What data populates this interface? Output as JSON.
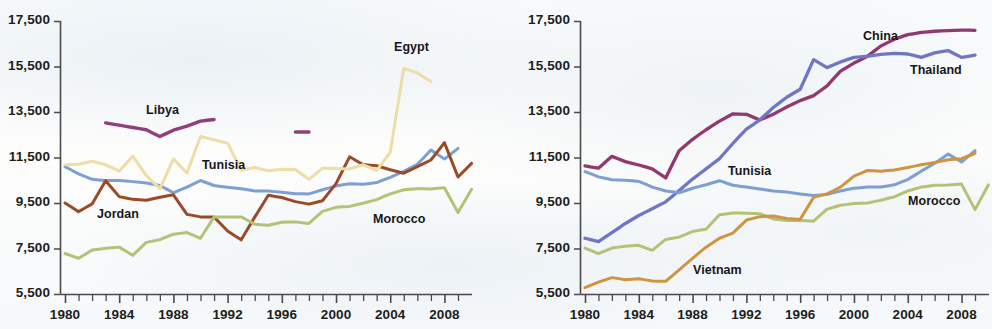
{
  "figure": {
    "background_color": "#fbfcfd",
    "axis_color": "#4a4a4a",
    "text_color": "#1d1d1b"
  },
  "panels": [
    {
      "id": "left",
      "name": "middle-east-north-africa-panel",
      "yticks": [
        "5,500",
        "7,500",
        "9,500",
        "11,500",
        "13,500",
        "15,500",
        "17,500"
      ],
      "xticks": [
        "1980",
        "1984",
        "1988",
        "1992",
        "1996",
        "2000",
        "2004",
        "2008"
      ],
      "series_labels": [
        {
          "text": "Libya",
          "x": 146,
          "y": 103
        },
        {
          "text": "Egypt",
          "x": 394,
          "y": 40
        },
        {
          "text": "Tunisia",
          "x": 202,
          "y": 158
        },
        {
          "text": "Jordan",
          "x": 97,
          "y": 207
        },
        {
          "text": "Morocco",
          "x": 373,
          "y": 212
        }
      ]
    },
    {
      "id": "right",
      "name": "east-asia-comparison-panel",
      "yticks": [
        "5,500",
        "7,500",
        "9,500",
        "11,500",
        "13,500",
        "15,500",
        "17,500"
      ],
      "xticks": [
        "1980",
        "1984",
        "1988",
        "1992",
        "1996",
        "2000",
        "2004",
        "2008"
      ],
      "series_labels": [
        {
          "text": "China",
          "x": 367,
          "y": 29
        },
        {
          "text": "Thailand",
          "x": 414,
          "y": 63
        },
        {
          "text": "Tunisia",
          "x": 232,
          "y": 164
        },
        {
          "text": "Vietnam",
          "x": 197,
          "y": 263
        },
        {
          "text": "Morocco",
          "x": 412,
          "y": 194
        }
      ]
    }
  ],
  "chart_data": [
    {
      "type": "line",
      "panel": "left",
      "title": "",
      "xlabel": "",
      "ylabel": "",
      "xlim": [
        1980,
        2009
      ],
      "ylim": [
        5500,
        17500
      ],
      "yticks": [
        5500,
        7500,
        9500,
        11500,
        13500,
        15500,
        17500
      ],
      "xticks": [
        1980,
        1984,
        1988,
        1992,
        1996,
        2000,
        2004,
        2008
      ],
      "grid": false,
      "legend": "inline-labels",
      "x": [
        1980,
        1981,
        1982,
        1983,
        1984,
        1985,
        1986,
        1987,
        1988,
        1989,
        1990,
        1991,
        1992,
        1993,
        1994,
        1995,
        1996,
        1997,
        1998,
        1999,
        2000,
        2001,
        2002,
        2003,
        2004,
        2005,
        2006,
        2007,
        2008,
        2009
      ],
      "series": [
        {
          "name": "Tunisia",
          "color": "#7d9fd4",
          "values": [
            11100,
            10780,
            10540,
            10490,
            10490,
            10440,
            10380,
            10270,
            9950,
            10200,
            10490,
            10270,
            10190,
            10130,
            10030,
            10030,
            9970,
            9910,
            9900,
            10080,
            10250,
            10350,
            10320,
            10400,
            10630,
            10890,
            11200,
            11830,
            11430,
            11900
          ]
        },
        {
          "name": "Jordan",
          "color": "#9b4a28",
          "values": [
            9500,
            9120,
            9460,
            10480,
            9780,
            9660,
            9620,
            9750,
            9860,
            9000,
            8890,
            8880,
            8270,
            7880,
            8880,
            9840,
            9740,
            9560,
            9450,
            9600,
            10350,
            11530,
            11190,
            11140,
            10960,
            10810,
            11100,
            11390,
            12150,
            10640,
            11240
          ]
        },
        {
          "name": "Egypt",
          "color": "#efdda7",
          "values": [
            11180,
            11200,
            11340,
            11180,
            10900,
            11560,
            10700,
            10130,
            11440,
            10820,
            12420,
            12280,
            12130,
            10950,
            11060,
            10920,
            10980,
            10970,
            10540,
            11030,
            11020,
            11000,
            11180,
            10920,
            11740,
            15420,
            15220,
            14840
          ]
        },
        {
          "name": "Morocco",
          "color": "#b6c178",
          "values": [
            7280,
            7070,
            7430,
            7510,
            7560,
            7200,
            7770,
            7890,
            8130,
            8200,
            7950,
            8880,
            8890,
            8890,
            8570,
            8520,
            8650,
            8670,
            8600,
            9130,
            9310,
            9350,
            9490,
            9650,
            9900,
            10080,
            10130,
            10120,
            10170,
            9080,
            10100
          ]
        },
        {
          "name": "Libya",
          "color": "#8e3f7e",
          "values": [
            null,
            null,
            null,
            13020,
            12920,
            12820,
            12720,
            12420,
            12700,
            12880,
            13100,
            13170
          ],
          "segment_years": [
            1983,
            1991
          ],
          "secondary_segment": {
            "years": [
              1997,
              1998
            ],
            "value": 12620
          }
        }
      ]
    },
    {
      "type": "line",
      "panel": "right",
      "title": "",
      "xlabel": "",
      "ylabel": "",
      "xlim": [
        1980,
        2009
      ],
      "ylim": [
        5500,
        17500
      ],
      "yticks": [
        5500,
        7500,
        9500,
        11500,
        13500,
        15500,
        17500
      ],
      "xticks": [
        1980,
        1984,
        1988,
        1992,
        1996,
        2000,
        2004,
        2008
      ],
      "grid": false,
      "legend": "inline-labels",
      "x": [
        1980,
        1981,
        1982,
        1983,
        1984,
        1985,
        1986,
        1987,
        1988,
        1989,
        1990,
        1991,
        1992,
        1993,
        1994,
        1995,
        1996,
        1997,
        1998,
        1999,
        2000,
        2001,
        2002,
        2003,
        2004,
        2005,
        2006,
        2007,
        2008,
        2009
      ],
      "series": [
        {
          "name": "China",
          "color": "#93386f",
          "values": [
            11130,
            11030,
            11550,
            11320,
            11170,
            11000,
            10600,
            11800,
            12300,
            12720,
            13100,
            13420,
            13400,
            13150,
            13400,
            13720,
            14000,
            14220,
            14650,
            15300,
            15650,
            15950,
            16400,
            16700,
            16900,
            17000,
            17050,
            17080,
            17100,
            17090
          ]
        },
        {
          "name": "Thailand",
          "color": "#6f77c4",
          "values": [
            7950,
            7800,
            8200,
            8600,
            8950,
            9250,
            9550,
            10050,
            10550,
            11000,
            11450,
            12120,
            12750,
            13150,
            13700,
            14150,
            14500,
            15800,
            15450,
            15700,
            15900,
            15950,
            16030,
            16080,
            16050,
            15900,
            16100,
            16200,
            15900,
            16000
          ]
        },
        {
          "name": "Tunisia",
          "color": "#7d9fd4",
          "values": [
            10880,
            10650,
            10520,
            10500,
            10450,
            10200,
            10030,
            9950,
            10150,
            10300,
            10480,
            10280,
            10200,
            10120,
            10030,
            9980,
            9900,
            9830,
            9880,
            10030,
            10150,
            10200,
            10200,
            10300,
            10530,
            10900,
            11250,
            11650,
            11300,
            11800
          ]
        },
        {
          "name": "Morocco",
          "color": "#b6c178",
          "values": [
            7520,
            7270,
            7520,
            7600,
            7640,
            7420,
            7900,
            8000,
            8250,
            8350,
            8980,
            9060,
            9050,
            9030,
            8800,
            8730,
            8730,
            8700,
            9230,
            9400,
            9480,
            9500,
            9620,
            9770,
            10030,
            10200,
            10280,
            10290,
            10330,
            9210,
            10300
          ]
        },
        {
          "name": "Vietnam",
          "color": "#cf9440",
          "values": [
            5780,
            6020,
            6220,
            6130,
            6170,
            6070,
            6060,
            6560,
            7070,
            7560,
            7950,
            8180,
            8750,
            8900,
            8930,
            8820,
            8780,
            9750,
            9900,
            10200,
            10680,
            10930,
            10900,
            10950,
            11060,
            11180,
            11280,
            11400,
            11450,
            11680
          ]
        }
      ]
    }
  ]
}
